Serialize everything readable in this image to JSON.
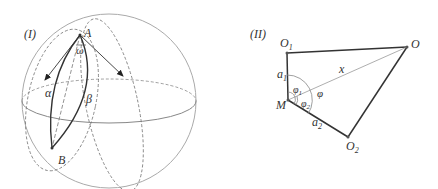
{
  "figure_I": {
    "panel_label": "(I)",
    "points": {
      "A": "A",
      "B": "B"
    },
    "arc_labels": {
      "alpha": "α",
      "beta": "β"
    },
    "angle_label": "ω"
  },
  "figure_II": {
    "panel_label": "(II)",
    "points": {
      "O1": "O",
      "O1_sub": "1",
      "O": "O",
      "O2": "O",
      "O2_sub": "2",
      "M": "M"
    },
    "segment_labels": {
      "a1": "a",
      "a1_sub": "1",
      "a2": "a",
      "a2_sub": "2",
      "x": "x"
    },
    "angle_labels": {
      "phi": "φ",
      "phi1": "φ",
      "phi1_sub": "1",
      "phi2": "φ",
      "phi2_sub": "2"
    }
  },
  "colors": {
    "thin": "#a8a8a8",
    "thick": "#333333",
    "dashed": "#777777"
  }
}
